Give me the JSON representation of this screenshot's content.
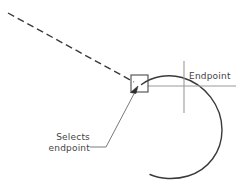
{
  "diagram": {
    "background_color": "#ffffff",
    "line_color": "#3a3a3a",
    "text_color": "#444444",
    "annotations": {
      "endpoint_label": "Endpoint",
      "selects_label_line1": "Selects",
      "selects_label_line2": "endpoint"
    },
    "elements": {
      "dashed_line_name": "rubber-band-line",
      "selection_box_name": "snap-selection-box",
      "arc_name": "arc-geometry",
      "crosshair_name": "crosshair-cursor",
      "leader_name": "leader-line",
      "arrow_name": "leader-arrowhead"
    },
    "geometry": {
      "dashed_line": {
        "x1": 8,
        "y1": 13,
        "x2": 134,
        "y2": 82
      },
      "selection_box": {
        "x": 131,
        "y": 75,
        "width": 17,
        "height": 17
      },
      "crosshair_vertical": {
        "x": 184,
        "y1": 61,
        "y2": 113
      },
      "crosshair_horizontal": {
        "y": 86,
        "x1": 148,
        "x2": 236
      },
      "arc_center": {
        "cx": 183,
        "cy": 128
      },
      "arc_radius": 46,
      "leader_start": {
        "x": 90,
        "y": 147
      },
      "leader_elbow": {
        "x": 106,
        "y": 147
      },
      "leader_end": {
        "x": 136,
        "y": 90
      }
    }
  }
}
